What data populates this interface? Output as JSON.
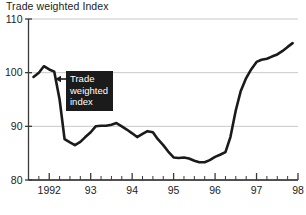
{
  "chart_data": {
    "type": "line",
    "title": "Trade weighted Index",
    "xlabel": "",
    "ylabel": "",
    "ylim": [
      80,
      110
    ],
    "xlim": [
      1991.5,
      1998.0
    ],
    "grid": true,
    "gridlines_y": [
      110,
      100,
      90,
      80
    ],
    "legend_position": "none",
    "y_tick_labels": [
      "110",
      "100",
      "90",
      "80"
    ],
    "y_ticks": [
      110,
      100,
      90,
      80
    ],
    "x_tick_labels": [
      "1992",
      "93",
      "94",
      "95",
      "96",
      "97",
      "98"
    ],
    "x_major_ticks": [
      1992,
      1993,
      1994,
      1995,
      1996,
      1997,
      1998
    ],
    "x_minor_tick_interval_years": 0.25,
    "series": [
      {
        "name": "Trade weighted index",
        "color": "#1a1a1a",
        "x": [
          1991.62,
          1991.75,
          1991.87,
          1992.0,
          1992.12,
          1992.25,
          1992.37,
          1992.5,
          1992.62,
          1992.75,
          1992.87,
          1993.0,
          1993.12,
          1993.25,
          1993.37,
          1993.5,
          1993.62,
          1993.75,
          1993.87,
          1994.0,
          1994.12,
          1994.25,
          1994.37,
          1994.5,
          1994.62,
          1994.75,
          1994.87,
          1995.0,
          1995.12,
          1995.25,
          1995.37,
          1995.5,
          1995.62,
          1995.75,
          1995.87,
          1996.0,
          1996.12,
          1996.25,
          1996.37,
          1996.5,
          1996.62,
          1996.75,
          1996.87,
          1997.0,
          1997.12,
          1997.25,
          1997.37,
          1997.5,
          1997.62,
          1997.75,
          1997.87
        ],
        "y": [
          99.2,
          100.0,
          101.2,
          100.6,
          100.2,
          95.0,
          87.6,
          87.0,
          86.5,
          87.1,
          88.0,
          88.9,
          90.0,
          90.1,
          90.1,
          90.3,
          90.6,
          90.0,
          89.4,
          88.7,
          88.0,
          88.6,
          89.1,
          88.9,
          87.6,
          86.5,
          85.3,
          84.2,
          84.1,
          84.2,
          84.0,
          83.6,
          83.3,
          83.3,
          83.7,
          84.3,
          84.7,
          85.2,
          88.0,
          93.0,
          96.6,
          99.0,
          100.6,
          102.0,
          102.4,
          102.6,
          103.0,
          103.4,
          104.0,
          104.8,
          105.5
        ]
      }
    ],
    "annotation": {
      "lines": [
        "Trade",
        "weighted",
        "index"
      ],
      "text": "Trade weighted index",
      "style": "white-on-black-box-with-left-arrow",
      "background_color": "#1b1b1b",
      "text_color": "#ffffff"
    },
    "colors": {
      "line": "#1a1a1a",
      "grid": "#c9c9c9",
      "axis": "#3a3a3a",
      "background": "#ffffff"
    }
  },
  "footer": {
    "note": ""
  }
}
